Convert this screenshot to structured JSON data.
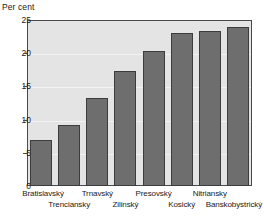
{
  "chart_data": {
    "type": "bar",
    "title": "",
    "subtitle": "",
    "xlabel": "",
    "ylabel": "Per cent",
    "ylim": [
      0,
      25
    ],
    "yticks": [
      0,
      5,
      10,
      15,
      20,
      25
    ],
    "ytick_labels": [
      "0",
      "5",
      "10",
      "15",
      "20",
      "25"
    ],
    "grid": true,
    "grid_axis": "y",
    "legend": false,
    "legend_position": "none",
    "categories": [
      "Bratislavský",
      "Trenciansky",
      "Trnavský",
      "Zilinský",
      "Presovský",
      "Kosický",
      "Nitriansky",
      "Banskobystrický"
    ],
    "values": [
      6.9,
      9.2,
      13.3,
      17.3,
      20.4,
      23.1,
      23.4,
      23.9
    ],
    "series": [
      {
        "name": "Per cent",
        "values": [
          6.9,
          9.2,
          13.3,
          17.3,
          20.4,
          23.1,
          23.4,
          23.9
        ]
      }
    ],
    "label_layout": "staggered-two-rows",
    "label_rows": [
      0,
      1,
      0,
      1,
      0,
      1,
      0,
      1
    ]
  },
  "colors": {
    "bar_fill": "#6e6e6e",
    "bar_edge": "#3c3c3c",
    "plot_background": "#e4e4e4",
    "gridline": "#f3f3f3",
    "axis": "#4a4a4a",
    "text": "#1a1a1a",
    "page_background": "#ffffff"
  },
  "axis": {
    "y_title": "Per cent"
  }
}
